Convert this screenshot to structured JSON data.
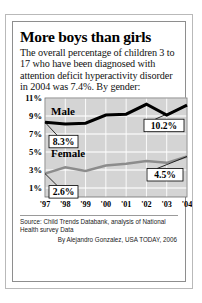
{
  "headline": "More boys than girls",
  "deck": "The overall percentage of children 3 to 17 who have been diagnosed with attention deficit hyperactivity disorder in 2004 was 7.4%. By gender:",
  "source": "Source: Child Trends Databank, analysis of National Health survey Data",
  "byline": "By Alejandro Gonzalez, USA TODAY, 2006",
  "labels": {
    "male": "Male",
    "female": "Female",
    "male_start": "8.3%",
    "male_end": "10.2%",
    "female_start": "2.6%",
    "female_end": "4.5%"
  },
  "colors": {
    "male_line": "#000000",
    "female_line": "#8c8c8c",
    "plot_background": "#d4d4d4",
    "grid": "#ffffff",
    "frame": "#6e6e6e"
  },
  "chart_data": {
    "type": "line",
    "title": "More boys than girls",
    "xlabel": "",
    "ylabel": "Percent diagnosed with ADHD",
    "x": [
      "'97",
      "'98",
      "'99",
      "'00",
      "'01",
      "'02",
      "'03",
      "'04"
    ],
    "ylim": [
      0,
      11
    ],
    "yticks": [
      1,
      3,
      5,
      7,
      9,
      11
    ],
    "ytick_labels": [
      "1%",
      "3%",
      "5%",
      "7%",
      "9%",
      "11%"
    ],
    "grid": true,
    "legend": "inline-labels",
    "series": [
      {
        "name": "Male",
        "color": "#000000",
        "values": [
          8.3,
          8.1,
          8.2,
          9.1,
          9.2,
          10.3,
          9.1,
          10.2
        ]
      },
      {
        "name": "Female",
        "color": "#8c8c8c",
        "values": [
          2.6,
          3.3,
          2.9,
          3.5,
          3.7,
          4.0,
          3.8,
          4.5
        ]
      }
    ],
    "annotations": [
      {
        "label": "8.3%",
        "series": "Male",
        "x": "'97",
        "value": 8.3
      },
      {
        "label": "10.2%",
        "series": "Male",
        "x": "'04",
        "value": 10.2
      },
      {
        "label": "2.6%",
        "series": "Female",
        "x": "'97",
        "value": 2.6
      },
      {
        "label": "4.5%",
        "series": "Female",
        "x": "'04",
        "value": 4.5
      }
    ]
  }
}
